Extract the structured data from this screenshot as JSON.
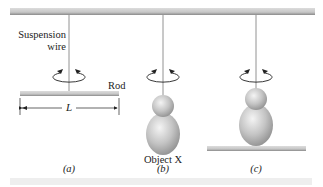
{
  "figure": {
    "labels": {
      "suspension_line1": "Suspension",
      "suspension_line2": "wire",
      "rod": "Rod",
      "length": "L",
      "object": "Object X"
    },
    "panels": [
      {
        "id": "a",
        "caption": "(a)"
      },
      {
        "id": "b",
        "caption": "(b)"
      },
      {
        "id": "c",
        "caption": "(c)"
      }
    ],
    "colors": {
      "ceiling": "#c9c9c9",
      "rod": "#b8b8b8",
      "wire": "#777777",
      "object": "#bdbdbd",
      "footer": "#eeeeee"
    }
  }
}
